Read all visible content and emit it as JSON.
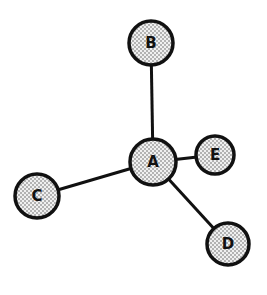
{
  "diagram": {
    "type": "star-graph",
    "colors": {
      "stroke": "#111111",
      "fill": "#e8e8e8",
      "dot": "#555555",
      "background": "#ffffff"
    },
    "nodes": [
      {
        "id": "A",
        "label": "A",
        "x": 153,
        "y": 162,
        "r": 23
      },
      {
        "id": "B",
        "label": "B",
        "x": 151,
        "y": 43,
        "r": 22
      },
      {
        "id": "C",
        "label": "C",
        "x": 37,
        "y": 196,
        "r": 22
      },
      {
        "id": "D",
        "label": "D",
        "x": 228,
        "y": 244,
        "r": 21
      },
      {
        "id": "E",
        "label": "E",
        "x": 215,
        "y": 155,
        "r": 19
      }
    ],
    "edges": [
      {
        "from": "A",
        "to": "B"
      },
      {
        "from": "A",
        "to": "C"
      },
      {
        "from": "A",
        "to": "D"
      },
      {
        "from": "A",
        "to": "E"
      }
    ]
  }
}
